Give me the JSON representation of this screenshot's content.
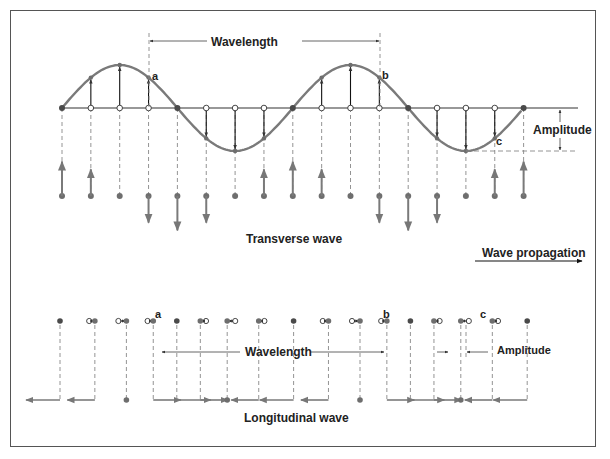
{
  "diagram": {
    "colors": {
      "wave": "#7a7a7a",
      "dot": "#6e6e6e",
      "dark_dot": "#4a4a4a",
      "arrow_black": "#111111",
      "arrow_gray": "#7a7a7a",
      "dash": "#888888",
      "text": "#222222",
      "border": "#555555"
    },
    "transverse": {
      "caption": "Transverse wave",
      "wavelength_label": "Wavelength",
      "amplitude_label": "Amplitude",
      "point_labels": [
        "a",
        "b",
        "c"
      ],
      "num_points": 17,
      "phases_per_point": "eighth-wavelength spacing, two full wavelengths"
    },
    "propagation": {
      "label": "Wave propagation",
      "direction": "right"
    },
    "longitudinal": {
      "caption": "Longitudinal wave",
      "wavelength_label": "Wavelength",
      "amplitude_label": "Amplitude",
      "point_labels": [
        "a",
        "b",
        "c"
      ]
    }
  }
}
